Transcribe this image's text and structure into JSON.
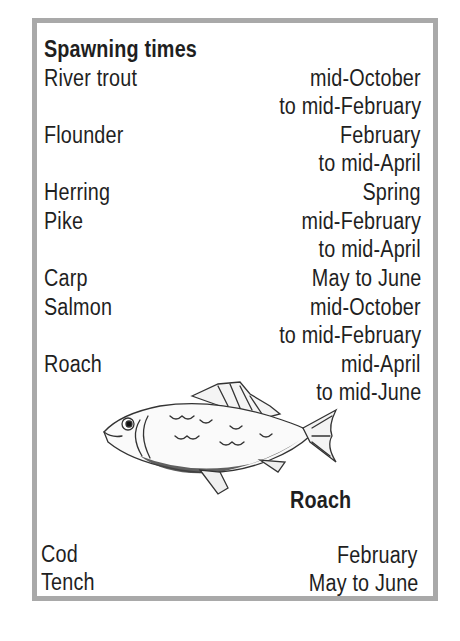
{
  "title": "Spawning times",
  "rows": [
    {
      "fish": "River trout",
      "lines": [
        "mid-October",
        "to mid-February"
      ]
    },
    {
      "fish": "Flounder",
      "lines": [
        "February",
        "to mid-April"
      ]
    },
    {
      "fish": "Herring",
      "lines": [
        "Spring"
      ]
    },
    {
      "fish": "Pike",
      "lines": [
        "mid-February",
        "to mid-April"
      ]
    },
    {
      "fish": "Carp",
      "lines": [
        "May to June"
      ]
    },
    {
      "fish": "Salmon",
      "lines": [
        "mid-October",
        "to mid-February"
      ]
    },
    {
      "fish": "Roach",
      "lines": [
        "mid-April",
        "to mid-June"
      ]
    },
    {
      "fish": "Cod",
      "lines": [
        "February"
      ]
    },
    {
      "fish": "Tench",
      "lines": [
        "May to June"
      ]
    }
  ],
  "illustration": {
    "caption": "Roach",
    "icon": "roach-fish-illustration"
  },
  "colors": {
    "border": "#a9a9a9",
    "text": "#1f1f1f"
  }
}
